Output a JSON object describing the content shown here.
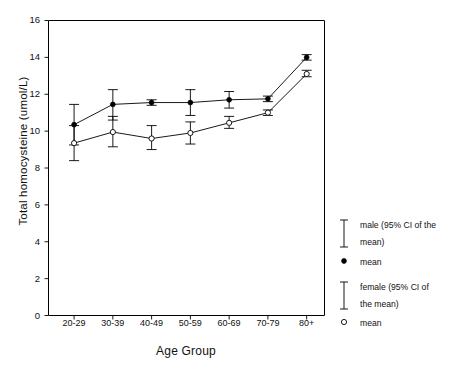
{
  "chart_data": {
    "type": "line",
    "title": "",
    "xlabel": "Age Group",
    "ylabel": "Total homocysteine (umol/L)",
    "categories": [
      "20-29",
      "30-39",
      "40-49",
      "50-59",
      "60-69",
      "70-79",
      "80+"
    ],
    "ylim": [
      0,
      16
    ],
    "yticks": [
      0,
      2,
      4,
      6,
      8,
      10,
      12,
      14,
      16
    ],
    "grid": false,
    "legend_position": "right",
    "series": [
      {
        "name": "male",
        "marker": "filled-circle",
        "values": [
          10.35,
          11.45,
          11.55,
          11.55,
          11.7,
          11.75,
          14.0
        ],
        "ci_lower": [
          9.25,
          10.6,
          11.4,
          10.85,
          11.25,
          11.6,
          13.85
        ],
        "ci_upper": [
          11.45,
          12.25,
          11.7,
          12.25,
          12.15,
          11.9,
          14.15
        ]
      },
      {
        "name": "female",
        "marker": "open-circle",
        "values": [
          9.35,
          9.95,
          9.6,
          9.9,
          10.45,
          11.0,
          13.1
        ],
        "ci_lower": [
          8.4,
          9.15,
          9.0,
          9.3,
          10.15,
          10.85,
          12.95
        ],
        "ci_upper": [
          10.3,
          10.8,
          10.3,
          10.5,
          10.8,
          11.15,
          13.3
        ]
      }
    ]
  },
  "legend": {
    "entries": [
      {
        "bar_label_line1": "male (95% CI of the",
        "bar_label_line2": "mean)",
        "marker_label": "mean",
        "marker": "filled-circle"
      },
      {
        "bar_label_line1": "female (95% CI of",
        "bar_label_line2": "the mean)",
        "marker_label": "mean",
        "marker": "open-circle"
      }
    ]
  },
  "colors": {
    "ink": "#000000",
    "background": "#ffffff"
  }
}
